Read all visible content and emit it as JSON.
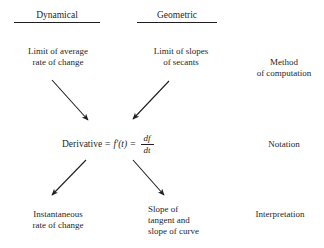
{
  "diagram": {
    "title_row": {
      "dynamical": "Dynamical",
      "geometric": "Geometric"
    },
    "row_labels": {
      "method": "Method\nof computation",
      "notation": "Notation",
      "interpretation": "Interpretation"
    },
    "top_nodes": {
      "left": "Limit of average\nrate of change",
      "right": "Limit of slopes\nof secants"
    },
    "center_formula": {
      "label": "Derivative",
      "equals_1": "=",
      "function_notation": "f′(t)",
      "equals_2": "=",
      "fraction_numerator": "df",
      "fraction_denominator": "dt",
      "plain_text": "Derivative = f′(t) = df/dt"
    },
    "bottom_nodes": {
      "left": "Instantaneous\nrate of change",
      "right": "Slope of\ntangent and\nslope of curve"
    },
    "colors": {
      "ink": "#1f1f1f",
      "background": "#ffffff"
    },
    "arrows": [
      {
        "name": "arrow-avg-rate-to-derivative",
        "from": [
          52,
          80
        ],
        "to": [
          91,
          124
        ]
      },
      {
        "name": "arrow-slopes-to-derivative",
        "from": [
          169,
          81
        ],
        "to": [
          130,
          123
        ]
      },
      {
        "name": "arrow-derivative-to-instantaneous",
        "from": [
          86,
          160
        ],
        "to": [
          49,
          199
        ]
      },
      {
        "name": "arrow-derivative-to-slope",
        "from": [
          133,
          160
        ],
        "to": [
          167,
          199
        ]
      }
    ]
  }
}
